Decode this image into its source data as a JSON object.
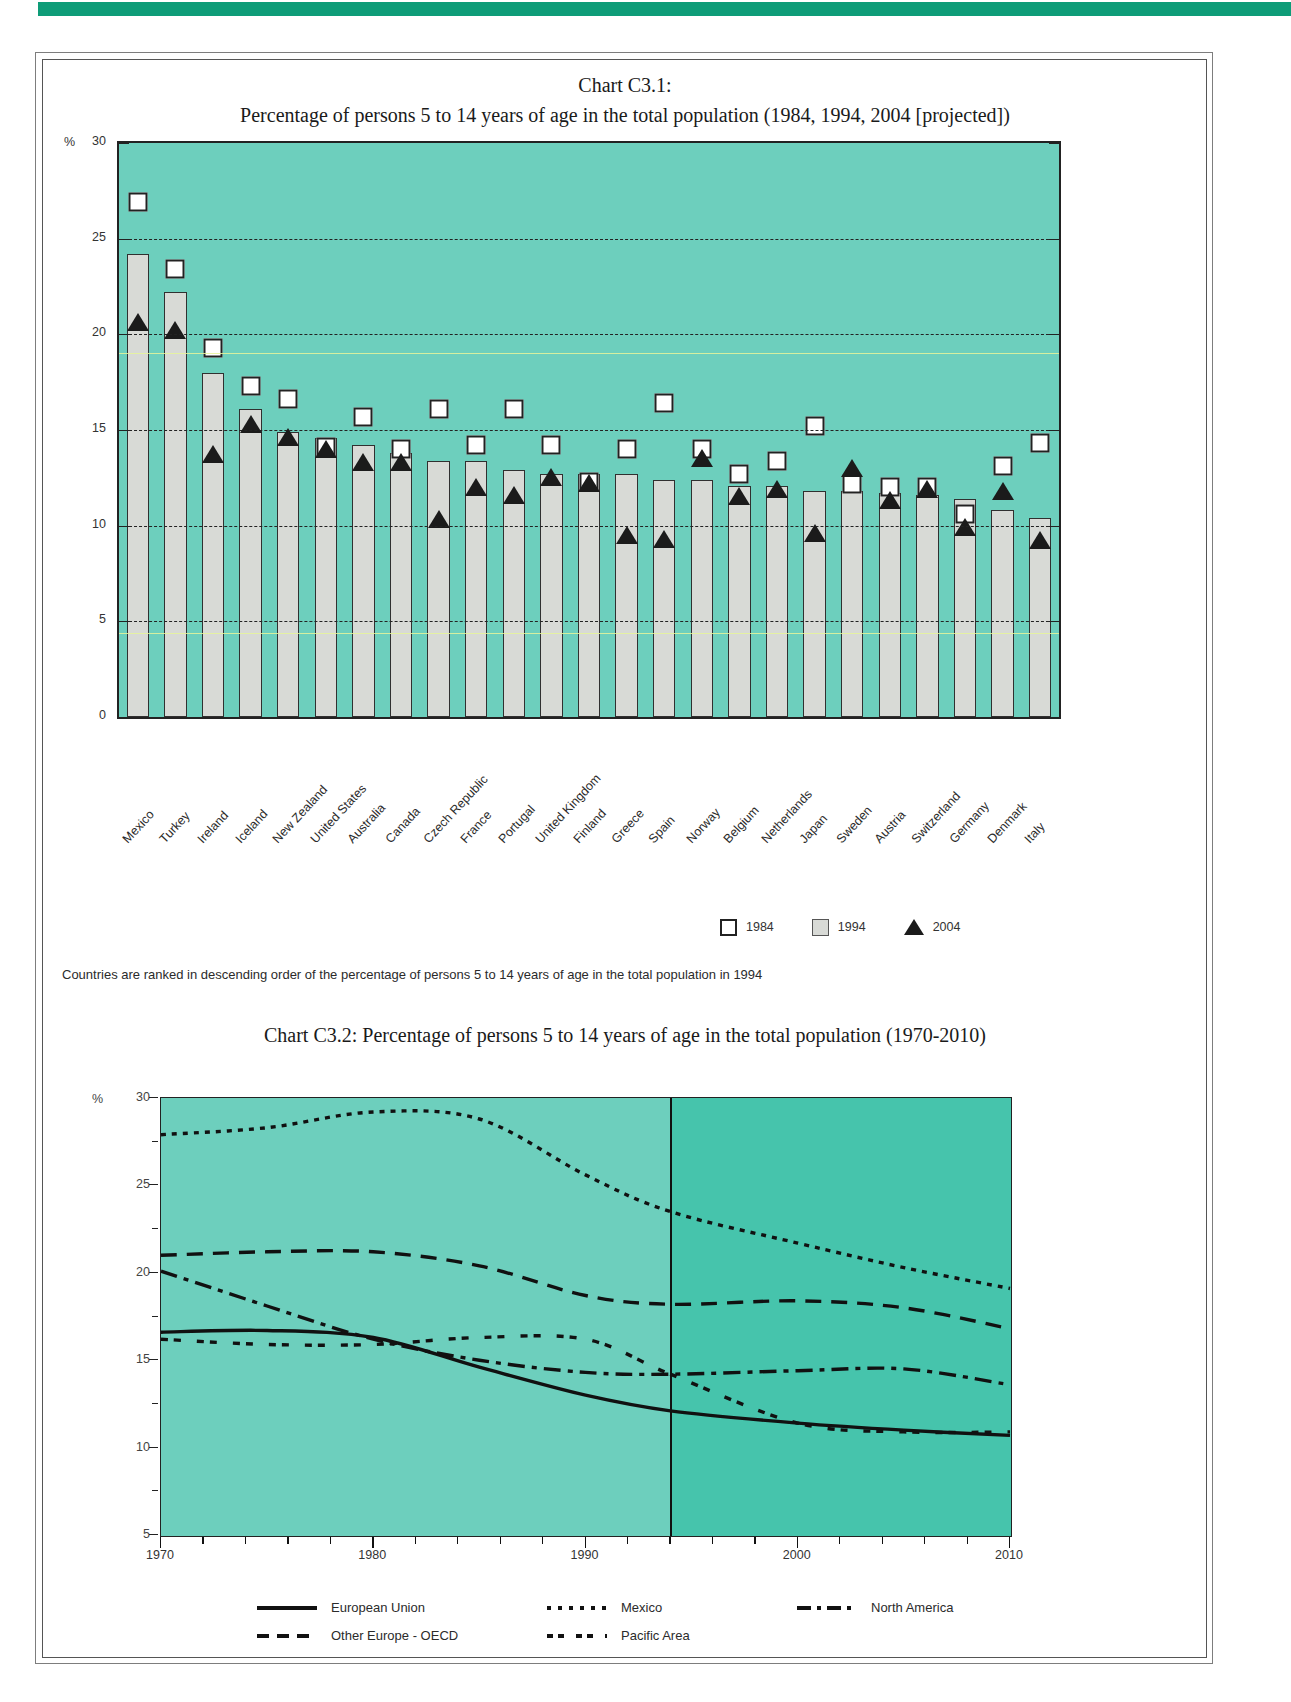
{
  "chart_data": [
    {
      "type": "bar",
      "id": "C3.1",
      "title_line1": "Chart C3.1:",
      "title_line2": "Percentage of persons 5 to 14 years of age in the total population (1984, 1994, 2004 [projected])",
      "ylabel": "%",
      "ylim": [
        0,
        30
      ],
      "yticks": [
        0,
        5,
        10,
        15,
        20,
        25,
        30
      ],
      "grid": "dashed horizontal gridlines at 5,10,15,20,25",
      "legend_position": "bottom-right",
      "note": "Countries are ranked in descending order of the percentage of persons 5 to 14 years of age in the total population in 1994",
      "categories": [
        "Mexico",
        "Turkey",
        "Ireland",
        "Iceland",
        "New Zealand",
        "United States",
        "Australia",
        "Canada",
        "Czech Republic",
        "France",
        "Portugal",
        "United Kingdom",
        "Finland",
        "Greece",
        "Spain",
        "Norway",
        "Belgium",
        "Netherlands",
        "Japan",
        "Sweden",
        "Austria",
        "Switzerland",
        "Germany",
        "Denmark",
        "Italy"
      ],
      "series": [
        {
          "name": "1984",
          "marker": "open-square",
          "values": [
            27.4,
            23.9,
            19.8,
            17.8,
            17.1,
            14.6,
            16.2,
            14.5,
            16.6,
            14.7,
            16.6,
            14.7,
            12.8,
            14.5,
            16.9,
            14.5,
            13.2,
            13.9,
            15.7,
            12.7,
            12.5,
            12.5,
            11.1,
            13.6,
            14.8
          ]
        },
        {
          "name": "1994",
          "marker": "grey-bar",
          "values": [
            24.2,
            22.2,
            18.0,
            16.1,
            14.9,
            14.6,
            14.2,
            13.8,
            13.4,
            13.4,
            12.9,
            12.7,
            12.7,
            12.7,
            12.4,
            12.4,
            12.1,
            12.1,
            11.8,
            11.8,
            11.7,
            11.6,
            11.4,
            10.8,
            10.4
          ]
        },
        {
          "name": "2004",
          "marker": "filled-triangle",
          "values": [
            21.1,
            20.7,
            14.2,
            15.8,
            15.1,
            14.5,
            13.8,
            13.8,
            10.8,
            12.5,
            12.1,
            13.0,
            12.7,
            10.0,
            9.8,
            14.0,
            12.0,
            12.4,
            10.1,
            13.5,
            11.8,
            12.4,
            10.4,
            12.3,
            9.7
          ]
        }
      ],
      "legend": [
        {
          "label": "1984",
          "marker": "open-square"
        },
        {
          "label": "1994",
          "marker": "grey-square"
        },
        {
          "label": "2004",
          "marker": "filled-triangle"
        }
      ]
    },
    {
      "type": "line",
      "id": "C3.2",
      "title_line1": "Chart C3.2:",
      "title_line2": "Percentage of persons 5 to 14 years of age in the total population (1970-2010)",
      "ylabel": "%",
      "ylim": [
        5,
        30
      ],
      "yticks": [
        5,
        10,
        15,
        20,
        25,
        30
      ],
      "xlim": [
        1970,
        2010
      ],
      "xticks": [
        1970,
        1980,
        1990,
        2000,
        2010
      ],
      "projection_start": 1994,
      "legend_position": "bottom",
      "x": [
        1970,
        1975,
        1980,
        1985,
        1990,
        1994,
        2000,
        2005,
        2010
      ],
      "series": [
        {
          "name": "European Union",
          "style": "solid",
          "values": [
            16.6,
            16.7,
            16.3,
            14.6,
            13.0,
            12.1,
            11.4,
            11.0,
            10.7
          ]
        },
        {
          "name": "Mexico",
          "style": "dotted",
          "values": [
            27.9,
            28.3,
            29.2,
            28.8,
            25.6,
            23.5,
            21.7,
            20.3,
            19.1
          ]
        },
        {
          "name": "North America",
          "style": "dash-dot",
          "values": [
            20.1,
            18.1,
            16.2,
            15.0,
            14.3,
            14.2,
            14.4,
            14.5,
            13.6
          ]
        },
        {
          "name": "Other Europe - OECD",
          "style": "dashed",
          "values": [
            21.0,
            21.2,
            21.2,
            20.4,
            18.7,
            18.2,
            18.4,
            18.0,
            16.8
          ]
        },
        {
          "name": "Pacific Area",
          "style": "dash-dot-dot",
          "values": [
            16.2,
            15.9,
            15.9,
            16.3,
            16.2,
            14.2,
            11.4,
            10.9,
            10.9
          ]
        }
      ],
      "legend": [
        {
          "label": "European Union",
          "style": "solid"
        },
        {
          "label": "Mexico",
          "style": "dotted"
        },
        {
          "label": "North America",
          "style": "dash-dot"
        },
        {
          "label": "Other Europe - OECD",
          "style": "dashed"
        },
        {
          "label": "Pacific Area",
          "style": "dash-dot-dot"
        }
      ]
    }
  ]
}
